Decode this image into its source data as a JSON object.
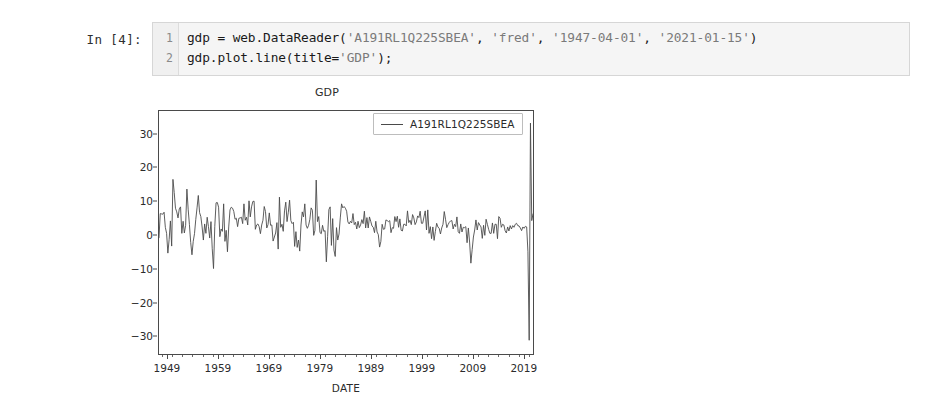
{
  "notebook": {
    "prompt": "In [4]:",
    "line_numbers": [
      "1",
      "2"
    ],
    "code": {
      "line1_part1": "gdp = web.DataReader(",
      "line1_str1": "'A191RL1Q225SBEA'",
      "line1_sep1": ", ",
      "line1_str2": "'fred'",
      "line1_sep2": ", ",
      "line1_str3": "'1947-04-01'",
      "line1_sep3": ", ",
      "line1_str4": "'2021-01-15'",
      "line1_end": ")",
      "line2_part1": "gdp.plot.line(title=",
      "line2_str1": "'GDP'",
      "line2_end": ");"
    }
  },
  "chart_data": {
    "type": "line",
    "title": "GDP",
    "xlabel": "DATE",
    "ylabel": "",
    "grid": false,
    "legend_position": "upper right",
    "series": [
      {
        "name": "A191RL1Q225SBEA",
        "color": "#4a4a4a"
      }
    ],
    "xlim": [
      1947.25,
      2021.0
    ],
    "ylim": [
      -35.5,
      37.0
    ],
    "yticks": [
      30,
      20,
      10,
      0,
      -10,
      -20,
      -30
    ],
    "ytick_labels": [
      "30",
      "20",
      "10",
      "0",
      "−10",
      "−20",
      "−30"
    ],
    "xticks": [
      1949,
      1959,
      1969,
      1979,
      1989,
      1999,
      2009,
      2019
    ],
    "xtick_labels": [
      "1949",
      "1959",
      "1969",
      "1979",
      "1989",
      "1999",
      "2009",
      "2019"
    ],
    "x": [
      1947.25,
      1947.5,
      1947.75,
      1948.0,
      1948.25,
      1948.5,
      1948.75,
      1949.0,
      1949.25,
      1949.5,
      1949.75,
      1950.0,
      1950.25,
      1950.5,
      1950.75,
      1951.0,
      1951.25,
      1951.5,
      1951.75,
      1952.0,
      1952.25,
      1952.5,
      1952.75,
      1953.0,
      1953.25,
      1953.5,
      1953.75,
      1954.0,
      1954.25,
      1954.5,
      1954.75,
      1955.0,
      1955.25,
      1955.5,
      1955.75,
      1956.0,
      1956.25,
      1956.5,
      1956.75,
      1957.0,
      1957.25,
      1957.5,
      1957.75,
      1958.0,
      1958.25,
      1958.5,
      1958.75,
      1959.0,
      1959.25,
      1959.5,
      1959.75,
      1960.0,
      1960.25,
      1960.5,
      1960.75,
      1961.0,
      1961.25,
      1961.5,
      1961.75,
      1962.0,
      1962.25,
      1962.5,
      1962.75,
      1963.0,
      1963.25,
      1963.5,
      1963.75,
      1964.0,
      1964.25,
      1964.5,
      1964.75,
      1965.0,
      1965.25,
      1965.5,
      1965.75,
      1966.0,
      1966.25,
      1966.5,
      1966.75,
      1967.0,
      1967.25,
      1967.5,
      1967.75,
      1968.0,
      1968.25,
      1968.5,
      1968.75,
      1969.0,
      1969.25,
      1969.5,
      1969.75,
      1970.0,
      1970.25,
      1970.5,
      1970.75,
      1971.0,
      1971.25,
      1971.5,
      1971.75,
      1972.0,
      1972.25,
      1972.5,
      1972.75,
      1973.0,
      1973.25,
      1973.5,
      1973.75,
      1974.0,
      1974.25,
      1974.5,
      1974.75,
      1975.0,
      1975.25,
      1975.5,
      1975.75,
      1976.0,
      1976.25,
      1976.5,
      1976.75,
      1977.0,
      1977.25,
      1977.5,
      1977.75,
      1978.0,
      1978.25,
      1978.5,
      1978.75,
      1979.0,
      1979.25,
      1979.5,
      1979.75,
      1980.0,
      1980.25,
      1980.5,
      1980.75,
      1981.0,
      1981.25,
      1981.5,
      1981.75,
      1982.0,
      1982.25,
      1982.5,
      1982.75,
      1983.0,
      1983.25,
      1983.5,
      1983.75,
      1984.0,
      1984.25,
      1984.5,
      1984.75,
      1985.0,
      1985.25,
      1985.5,
      1985.75,
      1986.0,
      1986.25,
      1986.5,
      1986.75,
      1987.0,
      1987.25,
      1987.5,
      1987.75,
      1988.0,
      1988.25,
      1988.5,
      1988.75,
      1989.0,
      1989.25,
      1989.5,
      1989.75,
      1990.0,
      1990.25,
      1990.5,
      1990.75,
      1991.0,
      1991.25,
      1991.5,
      1991.75,
      1992.0,
      1992.25,
      1992.5,
      1992.75,
      1993.0,
      1993.25,
      1993.5,
      1993.75,
      1994.0,
      1994.25,
      1994.5,
      1994.75,
      1995.0,
      1995.25,
      1995.5,
      1995.75,
      1996.0,
      1996.25,
      1996.5,
      1996.75,
      1997.0,
      1997.25,
      1997.5,
      1997.75,
      1998.0,
      1998.25,
      1998.5,
      1998.75,
      1999.0,
      1999.25,
      1999.5,
      1999.75,
      2000.0,
      2000.25,
      2000.5,
      2000.75,
      2001.0,
      2001.25,
      2001.5,
      2001.75,
      2002.0,
      2002.25,
      2002.5,
      2002.75,
      2003.0,
      2003.25,
      2003.5,
      2003.75,
      2004.0,
      2004.25,
      2004.5,
      2004.75,
      2005.0,
      2005.25,
      2005.5,
      2005.75,
      2006.0,
      2006.25,
      2006.5,
      2006.75,
      2007.0,
      2007.25,
      2007.5,
      2007.75,
      2008.0,
      2008.25,
      2008.5,
      2008.75,
      2009.0,
      2009.25,
      2009.5,
      2009.75,
      2010.0,
      2010.25,
      2010.5,
      2010.75,
      2011.0,
      2011.25,
      2011.5,
      2011.75,
      2012.0,
      2012.25,
      2012.5,
      2012.75,
      2013.0,
      2013.25,
      2013.5,
      2013.75,
      2014.0,
      2014.25,
      2014.5,
      2014.75,
      2015.0,
      2015.25,
      2015.5,
      2015.75,
      2016.0,
      2016.25,
      2016.5,
      2016.75,
      2017.0,
      2017.25,
      2017.5,
      2017.75,
      2018.0,
      2018.25,
      2018.5,
      2018.75,
      2019.0,
      2019.25,
      2019.5,
      2019.75,
      2020.0,
      2020.25,
      2020.5,
      2020.75,
      2021.0
    ],
    "values": [
      -0.8,
      6.4,
      6.3,
      6.2,
      6.8,
      2.3,
      0.5,
      -5.4,
      -1.3,
      4.2,
      -3.3,
      16.6,
      12.7,
      8.0,
      6.9,
      5.1,
      7.8,
      8.4,
      0.5,
      4.1,
      0.6,
      2.9,
      13.7,
      7.7,
      3.1,
      -2.2,
      -5.9,
      -1.9,
      0.4,
      4.6,
      8.1,
      11.8,
      6.7,
      5.5,
      2.4,
      -1.5,
      3.3,
      0.5,
      5.3,
      2.5,
      -0.9,
      4.0,
      -4.1,
      -10.0,
      2.6,
      9.6,
      9.7,
      8.3,
      -0.5,
      1.8,
      1.1,
      9.3,
      -1.9,
      1.4,
      -5.0,
      2.4,
      7.5,
      8.3,
      8.0,
      7.0,
      4.7,
      5.0,
      2.5,
      5.0,
      5.1,
      5.3,
      3.4,
      9.3,
      4.4,
      5.3,
      3.0,
      10.2,
      5.4,
      8.4,
      10.0,
      10.1,
      1.7,
      3.0,
      3.3,
      2.5,
      0.4,
      3.0,
      4.4,
      8.5,
      7.0,
      2.1,
      3.1,
      6.6,
      2.9,
      3.0,
      -1.8,
      -0.6,
      0.6,
      3.7,
      -4.2,
      11.3,
      2.3,
      3.2,
      1.1,
      7.2,
      9.8,
      4.0,
      6.8,
      10.4,
      4.3,
      3.4,
      3.8,
      -3.4,
      1.0,
      -3.7,
      -1.5,
      -4.8,
      3.0,
      6.9,
      5.4,
      9.3,
      3.0,
      2.0,
      2.9,
      4.7,
      8.1,
      7.4,
      -0.1,
      1.4,
      16.4,
      4.0,
      5.5,
      0.7,
      0.4,
      2.9,
      1.1,
      1.3,
      -8.0,
      -0.5,
      7.6,
      8.4,
      -3.1,
      4.9,
      -4.5,
      -6.4,
      2.2,
      -1.5,
      0.3,
      5.1,
      9.3,
      8.1,
      8.5,
      8.0,
      7.1,
      3.9,
      3.3,
      4.1,
      3.6,
      6.4,
      3.1,
      3.8,
      1.8,
      4.1,
      2.2,
      3.0,
      4.6,
      3.4,
      7.1,
      2.1,
      5.2,
      2.1,
      5.4,
      4.1,
      2.7,
      2.3,
      0.7,
      4.1,
      0.9,
      0.1,
      -3.6,
      -1.9,
      3.2,
      1.7,
      1.8,
      4.5,
      4.3,
      4.0,
      4.3,
      0.7,
      2.2,
      2.0,
      5.5,
      4.0,
      5.6,
      2.3,
      4.8,
      1.4,
      1.2,
      3.2,
      3.2,
      2.7,
      7.2,
      3.7,
      4.4,
      3.1,
      6.1,
      5.1,
      3.1,
      3.9,
      5.7,
      5.2,
      7.1,
      3.5,
      3.5,
      5.4,
      7.2,
      1.5,
      7.5,
      0.5,
      2.5,
      -1.1,
      2.4,
      -1.6,
      1.1,
      3.5,
      2.4,
      2.0,
      0.3,
      2.1,
      3.2,
      7.0,
      4.7,
      2.2,
      3.1,
      3.8,
      4.2,
      4.3,
      1.8,
      3.2,
      2.5,
      5.4,
      1.0,
      0.5,
      3.3,
      0.9,
      2.3,
      2.2,
      2.5,
      -2.3,
      2.1,
      -2.1,
      -8.4,
      -4.4,
      -0.6,
      1.5,
      4.5,
      1.5,
      3.7,
      3.0,
      2.4,
      -1.0,
      2.9,
      -0.1,
      4.7,
      3.2,
      1.7,
      0.5,
      0.5,
      3.6,
      0.5,
      3.2,
      3.2,
      -1.1,
      5.5,
      5.0,
      2.3,
      3.2,
      3.0,
      1.3,
      0.6,
      2.4,
      1.2,
      2.8,
      1.8,
      2.8,
      2.3,
      3.2,
      3.5,
      2.8,
      2.7,
      2.1,
      1.3,
      2.4,
      2.0,
      2.6,
      2.4,
      -5.0,
      -31.4,
      33.4,
      4.3,
      6.3
    ]
  }
}
